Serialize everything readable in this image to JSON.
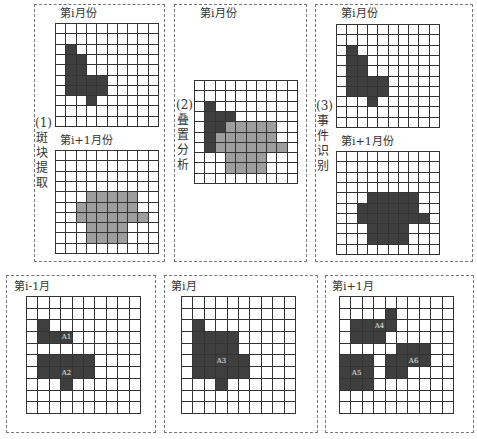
{
  "colors": {
    "dark": "#3f3f3f",
    "gray": "#9e9e9e",
    "grid_line": "#333333",
    "dashed_border": "#777777"
  },
  "top_row": {
    "panel1": {
      "step_label": "(1)",
      "step_chars": [
        "斑",
        "块",
        "提",
        "取"
      ],
      "top_title": "第i月份",
      "bottom_title": "第i+1月份"
    },
    "panel2": {
      "step_label": "(2)",
      "step_chars": [
        "叠",
        "置",
        "分",
        "析"
      ],
      "title": "第i月份"
    },
    "panel3": {
      "step_label": "(3)",
      "step_chars": [
        "事",
        "件",
        "识",
        "别"
      ],
      "top_title": "第i月份",
      "bottom_title": "第i+1月份"
    }
  },
  "bottom_row": {
    "left": {
      "title": "第i-1月"
    },
    "middle": {
      "title": "第i月"
    },
    "right": {
      "title": "第i+1月"
    }
  },
  "grids": {
    "month_i": {
      "size": [
        10,
        10
      ],
      "cells": [
        [
          2,
          1,
          "d"
        ],
        [
          3,
          1,
          "d"
        ],
        [
          3,
          2,
          "d"
        ],
        [
          4,
          1,
          "d"
        ],
        [
          4,
          2,
          "d"
        ],
        [
          5,
          1,
          "d"
        ],
        [
          5,
          2,
          "d"
        ],
        [
          5,
          3,
          "d"
        ],
        [
          5,
          4,
          "d"
        ],
        [
          6,
          1,
          "d"
        ],
        [
          6,
          2,
          "d"
        ],
        [
          6,
          3,
          "d"
        ],
        [
          6,
          4,
          "d"
        ],
        [
          7,
          3,
          "d"
        ]
      ]
    },
    "month_i1_gray": {
      "size": [
        10,
        10
      ],
      "cells": [
        [
          4,
          3,
          "g"
        ],
        [
          4,
          4,
          "g"
        ],
        [
          4,
          5,
          "g"
        ],
        [
          4,
          6,
          "g"
        ],
        [
          4,
          7,
          "g"
        ],
        [
          5,
          2,
          "g"
        ],
        [
          5,
          3,
          "g"
        ],
        [
          5,
          4,
          "g"
        ],
        [
          5,
          5,
          "g"
        ],
        [
          5,
          6,
          "g"
        ],
        [
          5,
          7,
          "g"
        ],
        [
          6,
          2,
          "g"
        ],
        [
          6,
          3,
          "g"
        ],
        [
          6,
          4,
          "g"
        ],
        [
          6,
          5,
          "g"
        ],
        [
          6,
          6,
          "g"
        ],
        [
          6,
          7,
          "g"
        ],
        [
          6,
          8,
          "g"
        ],
        [
          7,
          3,
          "g"
        ],
        [
          7,
          4,
          "g"
        ],
        [
          7,
          5,
          "g"
        ],
        [
          7,
          6,
          "g"
        ],
        [
          8,
          3,
          "g"
        ],
        [
          8,
          4,
          "g"
        ],
        [
          8,
          5,
          "g"
        ],
        [
          8,
          6,
          "g"
        ]
      ]
    },
    "overlay": {
      "size": [
        10,
        10
      ],
      "cells": [
        [
          2,
          1,
          "d"
        ],
        [
          3,
          1,
          "d"
        ],
        [
          3,
          2,
          "d"
        ],
        [
          3,
          3,
          "d"
        ],
        [
          4,
          1,
          "d"
        ],
        [
          4,
          2,
          "d"
        ],
        [
          4,
          3,
          "g"
        ],
        [
          4,
          4,
          "g"
        ],
        [
          4,
          5,
          "g"
        ],
        [
          4,
          6,
          "g"
        ],
        [
          4,
          7,
          "g"
        ],
        [
          5,
          1,
          "d"
        ],
        [
          5,
          2,
          "g"
        ],
        [
          5,
          3,
          "g"
        ],
        [
          5,
          4,
          "g"
        ],
        [
          5,
          5,
          "g"
        ],
        [
          5,
          6,
          "g"
        ],
        [
          5,
          7,
          "g"
        ],
        [
          6,
          1,
          "d"
        ],
        [
          6,
          2,
          "g"
        ],
        [
          6,
          3,
          "g"
        ],
        [
          6,
          4,
          "g"
        ],
        [
          6,
          5,
          "g"
        ],
        [
          6,
          6,
          "g"
        ],
        [
          6,
          7,
          "g"
        ],
        [
          6,
          8,
          "g"
        ],
        [
          7,
          3,
          "g"
        ],
        [
          7,
          4,
          "g"
        ],
        [
          7,
          5,
          "g"
        ],
        [
          7,
          6,
          "g"
        ],
        [
          8,
          3,
          "g"
        ],
        [
          8,
          4,
          "g"
        ],
        [
          8,
          5,
          "g"
        ],
        [
          8,
          6,
          "g"
        ]
      ]
    },
    "month_i1_dark": {
      "size": [
        10,
        10
      ],
      "cells": [
        [
          4,
          3,
          "d"
        ],
        [
          4,
          4,
          "d"
        ],
        [
          4,
          5,
          "d"
        ],
        [
          4,
          6,
          "d"
        ],
        [
          4,
          7,
          "d"
        ],
        [
          5,
          2,
          "d"
        ],
        [
          5,
          3,
          "d"
        ],
        [
          5,
          4,
          "d"
        ],
        [
          5,
          5,
          "d"
        ],
        [
          5,
          6,
          "d"
        ],
        [
          5,
          7,
          "d"
        ],
        [
          6,
          2,
          "d"
        ],
        [
          6,
          3,
          "d"
        ],
        [
          6,
          4,
          "d"
        ],
        [
          6,
          5,
          "d"
        ],
        [
          6,
          6,
          "d"
        ],
        [
          6,
          7,
          "d"
        ],
        [
          6,
          8,
          "d"
        ],
        [
          7,
          3,
          "d"
        ],
        [
          7,
          4,
          "d"
        ],
        [
          7,
          5,
          "d"
        ],
        [
          7,
          6,
          "d"
        ],
        [
          8,
          3,
          "d"
        ],
        [
          8,
          4,
          "d"
        ],
        [
          8,
          5,
          "d"
        ],
        [
          8,
          6,
          "d"
        ]
      ]
    },
    "bottom_prev": {
      "size": [
        10,
        10
      ],
      "cells": [
        [
          2,
          1,
          "d"
        ],
        [
          3,
          1,
          "d"
        ],
        [
          3,
          2,
          "d"
        ],
        [
          3,
          3,
          "d",
          "A1"
        ],
        [
          5,
          1,
          "d"
        ],
        [
          5,
          2,
          "d"
        ],
        [
          5,
          3,
          "d"
        ],
        [
          5,
          4,
          "d"
        ],
        [
          5,
          5,
          "d"
        ],
        [
          6,
          1,
          "d"
        ],
        [
          6,
          2,
          "d"
        ],
        [
          6,
          3,
          "d",
          "A2"
        ],
        [
          6,
          4,
          "d"
        ],
        [
          6,
          5,
          "d"
        ],
        [
          7,
          3,
          "d"
        ]
      ]
    },
    "bottom_cur": {
      "size": [
        10,
        10
      ],
      "cells": [
        [
          2,
          1,
          "d"
        ],
        [
          3,
          1,
          "d"
        ],
        [
          3,
          2,
          "d"
        ],
        [
          3,
          3,
          "d"
        ],
        [
          3,
          4,
          "d"
        ],
        [
          4,
          1,
          "d"
        ],
        [
          4,
          2,
          "d"
        ],
        [
          4,
          3,
          "d"
        ],
        [
          4,
          4,
          "d"
        ],
        [
          5,
          1,
          "d"
        ],
        [
          5,
          2,
          "d"
        ],
        [
          5,
          3,
          "d",
          "A3"
        ],
        [
          5,
          4,
          "d"
        ],
        [
          5,
          5,
          "d"
        ],
        [
          6,
          1,
          "d"
        ],
        [
          6,
          2,
          "d"
        ],
        [
          6,
          3,
          "d"
        ],
        [
          6,
          4,
          "d"
        ],
        [
          6,
          5,
          "d"
        ],
        [
          7,
          3,
          "d"
        ]
      ]
    },
    "bottom_next": {
      "size": [
        10,
        10
      ],
      "cells": [
        [
          1,
          4,
          "d"
        ],
        [
          2,
          1,
          "d"
        ],
        [
          2,
          2,
          "d"
        ],
        [
          2,
          3,
          "d",
          "A4"
        ],
        [
          2,
          4,
          "d"
        ],
        [
          3,
          1,
          "d"
        ],
        [
          3,
          2,
          "d"
        ],
        [
          3,
          3,
          "d"
        ],
        [
          4,
          5,
          "d"
        ],
        [
          4,
          6,
          "d"
        ],
        [
          4,
          7,
          "d"
        ],
        [
          5,
          0,
          "d"
        ],
        [
          5,
          1,
          "d"
        ],
        [
          5,
          2,
          "d"
        ],
        [
          5,
          4,
          "d"
        ],
        [
          5,
          5,
          "d"
        ],
        [
          5,
          6,
          "d",
          "A6"
        ],
        [
          5,
          7,
          "d"
        ],
        [
          6,
          0,
          "d"
        ],
        [
          6,
          1,
          "d",
          "A5"
        ],
        [
          6,
          2,
          "d"
        ],
        [
          6,
          4,
          "d"
        ],
        [
          6,
          5,
          "d"
        ],
        [
          7,
          0,
          "d"
        ],
        [
          7,
          1,
          "d"
        ],
        [
          7,
          2,
          "d"
        ]
      ]
    }
  }
}
